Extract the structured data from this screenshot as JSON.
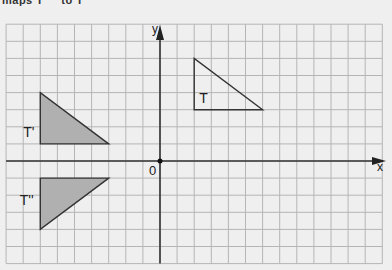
{
  "caption": "maps T     to T'",
  "diagram": {
    "grid": {
      "xmin": -9,
      "xmax": 13,
      "ymin": -6,
      "ymax": 8,
      "unit_px": 17.1,
      "origin_px": [
        160,
        161
      ],
      "line_color": "#b5b5b5",
      "background": "#efefef"
    },
    "axes": {
      "x_label": "x",
      "y_label": "y",
      "origin_label": "0",
      "color": "#333333"
    },
    "shapes": [
      {
        "name": "T",
        "label": "T",
        "vertices": [
          [
            2,
            3
          ],
          [
            2,
            6
          ],
          [
            6,
            3
          ]
        ],
        "fill": "none",
        "label_pos": [
          2.3,
          3.4
        ]
      },
      {
        "name": "T'",
        "label": "T'",
        "vertices": [
          [
            -7,
            1
          ],
          [
            -7,
            4
          ],
          [
            -3,
            1
          ]
        ],
        "fill": "#b0b0b0",
        "label_pos": [
          -8.0,
          1.4
        ]
      },
      {
        "name": "T''",
        "label": "T''",
        "vertices": [
          [
            -7,
            -1
          ],
          [
            -3,
            -1
          ],
          [
            -7,
            -4
          ]
        ],
        "fill": "#b0b0b0",
        "label_pos": [
          -8.2,
          -2.6
        ]
      }
    ]
  }
}
